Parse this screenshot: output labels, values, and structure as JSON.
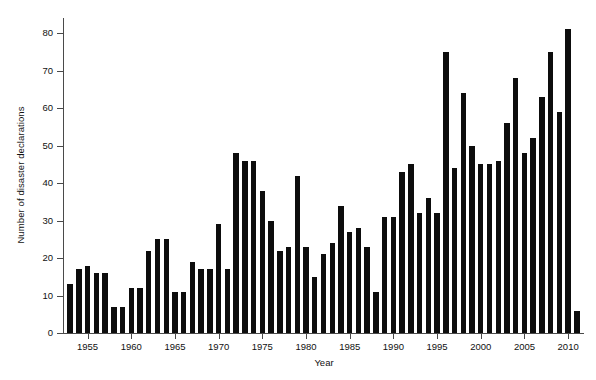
{
  "chart_data": {
    "type": "bar",
    "title": "",
    "xlabel": "Year",
    "ylabel": "Number of disaster declarations",
    "xlim": [
      1952.3,
      2011.7
    ],
    "ylim": [
      0,
      84
    ],
    "yticks": [
      0,
      10,
      20,
      30,
      40,
      50,
      60,
      70,
      80
    ],
    "xticks": [
      1955,
      1960,
      1965,
      1970,
      1975,
      1980,
      1985,
      1990,
      1995,
      2000,
      2005,
      2010
    ],
    "grid": false,
    "legend": null,
    "bar_color": "#0d0d0d",
    "axis_color": "#4a4a4a",
    "categories": [
      1953,
      1954,
      1955,
      1956,
      1957,
      1958,
      1959,
      1960,
      1961,
      1962,
      1963,
      1964,
      1965,
      1966,
      1967,
      1968,
      1969,
      1970,
      1971,
      1972,
      1973,
      1974,
      1975,
      1976,
      1977,
      1978,
      1979,
      1980,
      1981,
      1982,
      1983,
      1984,
      1985,
      1986,
      1987,
      1988,
      1989,
      1990,
      1991,
      1992,
      1993,
      1994,
      1995,
      1996,
      1997,
      1998,
      1999,
      2000,
      2001,
      2002,
      2003,
      2004,
      2005,
      2006,
      2007,
      2008,
      2009,
      2010,
      2011
    ],
    "values": [
      13,
      17,
      18,
      16,
      16,
      7,
      7,
      12,
      12,
      22,
      25,
      25,
      11,
      11,
      19,
      17,
      17,
      29,
      17,
      48,
      46,
      46,
      38,
      30,
      22,
      23,
      42,
      23,
      15,
      21,
      24,
      34,
      27,
      28,
      23,
      11,
      31,
      31,
      43,
      45,
      32,
      36,
      32,
      75,
      44,
      64,
      50,
      45,
      45,
      46,
      56,
      68,
      48,
      52,
      63,
      75,
      59,
      81,
      6
    ]
  },
  "axes": {
    "y_title": "Number of disaster declarations",
    "x_title": "Year",
    "y_tick_labels": [
      "0",
      "10",
      "20",
      "30",
      "40",
      "50",
      "60",
      "70",
      "80"
    ],
    "x_tick_labels": [
      "1955",
      "1960",
      "1965",
      "1970",
      "1975",
      "1980",
      "1985",
      "1990",
      "1995",
      "2000",
      "2005",
      "2010"
    ]
  }
}
